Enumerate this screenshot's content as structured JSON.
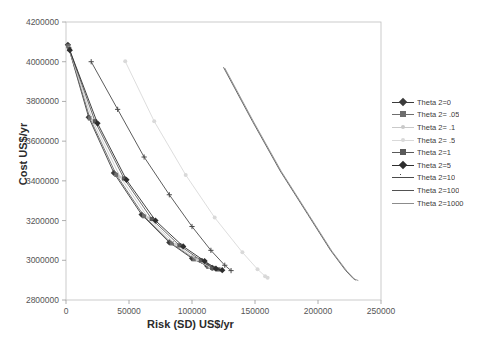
{
  "chart_title": "",
  "axes": {
    "xlabel": "Risk (SD) US$/yr",
    "ylabel": "Cost US$/yr",
    "xticks": [
      "0",
      "50000",
      "100000",
      "150000",
      "200000",
      "250000"
    ],
    "yticks": [
      "2800000",
      "3000000",
      "3200000",
      "3400000",
      "3600000",
      "3800000",
      "4000000",
      "4200000"
    ]
  },
  "chart_data": {
    "type": "line",
    "title": "",
    "xlabel": "Risk (SD) US$/yr",
    "ylabel": "Cost US$/yr",
    "xlim": [
      0,
      250000
    ],
    "ylim": [
      2800000,
      4200000
    ],
    "xtick_values": [
      0,
      50000,
      100000,
      150000,
      200000,
      250000
    ],
    "ytick_values": [
      2800000,
      3000000,
      3200000,
      3400000,
      3600000,
      3800000,
      4000000,
      4200000
    ],
    "grid": false,
    "legend_position": "right",
    "series": [
      {
        "name": "Theta 2=0",
        "color": "#3b3b3b",
        "marker": "diamond",
        "points": [
          [
            1500,
            4085000
          ],
          [
            18000,
            3720000
          ],
          [
            38000,
            3440000
          ],
          [
            60000,
            3230000
          ],
          [
            82000,
            3090000
          ],
          [
            100000,
            3010000
          ],
          [
            112000,
            2972000
          ],
          [
            116000,
            2962000
          ]
        ]
      },
      {
        "name": "Theta 2= .05",
        "color": "#6e6e6e",
        "marker": "square",
        "points": [
          [
            1800,
            4078000
          ],
          [
            19000,
            3715000
          ],
          [
            40000,
            3430000
          ],
          [
            62000,
            3222000
          ],
          [
            84000,
            3085000
          ],
          [
            102000,
            3005000
          ],
          [
            113000,
            2968000
          ],
          [
            117000,
            2960000
          ]
        ]
      },
      {
        "name": "Theta 2= .1",
        "color": "#c9c9c9",
        "marker": "dot",
        "points": [
          [
            2200,
            4070000
          ],
          [
            21000,
            3705000
          ],
          [
            43000,
            3420000
          ],
          [
            65000,
            3215000
          ],
          [
            87000,
            3080000
          ],
          [
            104000,
            3002000
          ],
          [
            114000,
            2966000
          ],
          [
            118000,
            2958000
          ]
        ]
      },
      {
        "name": "Theta 2= .5",
        "color": "#d9d9d9",
        "marker": "star",
        "points": [
          [
            47000,
            4002000
          ],
          [
            70000,
            3700000
          ],
          [
            95000,
            3430000
          ],
          [
            118000,
            3215000
          ],
          [
            140000,
            3040000
          ],
          [
            152000,
            2955000
          ],
          [
            158000,
            2920000
          ],
          [
            160000,
            2912000
          ]
        ]
      },
      {
        "name": "Theta 2=1",
        "color": "#5a5a5a",
        "marker": "square",
        "points": [
          [
            2600,
            4064000
          ],
          [
            23000,
            3700000
          ],
          [
            46000,
            3412000
          ],
          [
            68000,
            3208000
          ],
          [
            90000,
            3075000
          ],
          [
            107000,
            3000000
          ],
          [
            116000,
            2962000
          ],
          [
            121000,
            2954000
          ]
        ]
      },
      {
        "name": "Theta 2=5",
        "color": "#2e2e2e",
        "marker": "diamond",
        "points": [
          [
            3000,
            4058000
          ],
          [
            25000,
            3690000
          ],
          [
            48000,
            3405000
          ],
          [
            71000,
            3200000
          ],
          [
            93000,
            3070000
          ],
          [
            110000,
            2996000
          ],
          [
            119000,
            2958000
          ],
          [
            124000,
            2950000
          ]
        ]
      },
      {
        "name": "Theta 2=10",
        "color": "#4a4a4a",
        "marker": "plus",
        "points": [
          [
            20000,
            4000000
          ],
          [
            41000,
            3760000
          ],
          [
            62000,
            3520000
          ],
          [
            82000,
            3330000
          ],
          [
            100000,
            3170000
          ],
          [
            115000,
            3050000
          ],
          [
            126000,
            2975000
          ],
          [
            131000,
            2948000
          ]
        ]
      },
      {
        "name": "Theta 2=100",
        "color": "#525252",
        "marker": "none",
        "points": [
          [
            125000,
            3972000
          ],
          [
            148000,
            3700000
          ],
          [
            170000,
            3450000
          ],
          [
            192000,
            3230000
          ],
          [
            210000,
            3050000
          ],
          [
            222000,
            2948000
          ],
          [
            228000,
            2908000
          ],
          [
            230000,
            2900000
          ]
        ]
      },
      {
        "name": "Theta 2=1000",
        "color": "#8c8c8c",
        "marker": "none",
        "points": [
          [
            126000,
            3968000
          ],
          [
            149000,
            3696000
          ],
          [
            171000,
            3446000
          ],
          [
            193000,
            3226000
          ],
          [
            211000,
            3046000
          ],
          [
            223000,
            2945000
          ],
          [
            229000,
            2905000
          ],
          [
            232000,
            2898000
          ]
        ]
      }
    ]
  }
}
